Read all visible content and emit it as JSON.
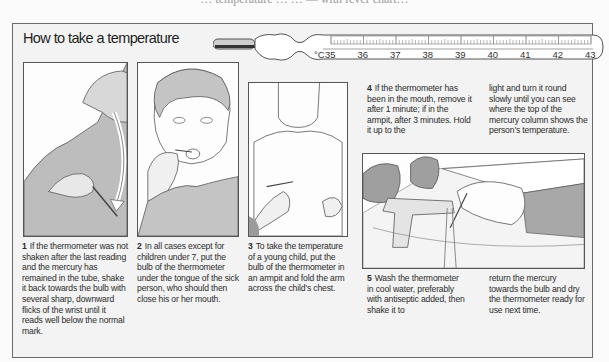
{
  "page": {
    "cut_header": "… temperature … … — with fever chart…",
    "title": "How to take a temperature"
  },
  "thermometer": {
    "unit_label": "°C",
    "scale": [
      "35",
      "36",
      "37",
      "38",
      "39",
      "40",
      "41",
      "42",
      "43"
    ],
    "icon": "clinical-thermometer-icon"
  },
  "steps": [
    {
      "number": "1",
      "text": "If the thermometer was not shaken after the last reading and the mercury has remained in the tube, shake it back towards the bulb with several sharp, downward flicks of the wrist until it reads well below the normal mark.",
      "illustration": "shaking-thermometer-illustration"
    },
    {
      "number": "2",
      "text": "In all cases except for children under 7, put the bulb of the thermometer under the tongue of the sick person, who should then close his or her mouth.",
      "illustration": "oral-thermometer-illustration"
    },
    {
      "number": "3",
      "text": "To take the temperature of a young child, put the bulb of the thermometer in an armpit and fold the arm across the child’s chest.",
      "illustration": "armpit-thermometer-illustration"
    },
    {
      "number": "4",
      "text_col1": "If the thermometer has been in the mouth, remove it after 1 minute; if in the armpit, after 3 minutes. Hold it up to the",
      "text_col2": "light and turn it round slowly until you can see where the top of the mercury column shows the person’s temperature."
    },
    {
      "number": "5",
      "text_col1": "Wash the thermometer in cool water, preferably with antiseptic added, then shake it to",
      "text_col2": "return the mercury towards the bulb and dry the thermometer ready for use next time.",
      "illustration": "washing-thermometer-illustration"
    }
  ]
}
